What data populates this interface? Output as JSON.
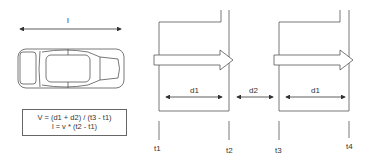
{
  "diagram": {
    "length_label": "l",
    "formula": {
      "line1": "V = (d1 + d2) / (t3 - t1)",
      "line2": "l = v * (t2 - t1)"
    },
    "sensor1": {
      "distance_label": "d1",
      "time_start": "t1",
      "time_end": "t2"
    },
    "gap": {
      "distance_label": "d2"
    },
    "sensor2": {
      "distance_label": "d1",
      "time_start": "t3",
      "time_end": "t4"
    },
    "colors": {
      "line": "#555555",
      "text": "#333333",
      "background": "#ffffff"
    }
  }
}
